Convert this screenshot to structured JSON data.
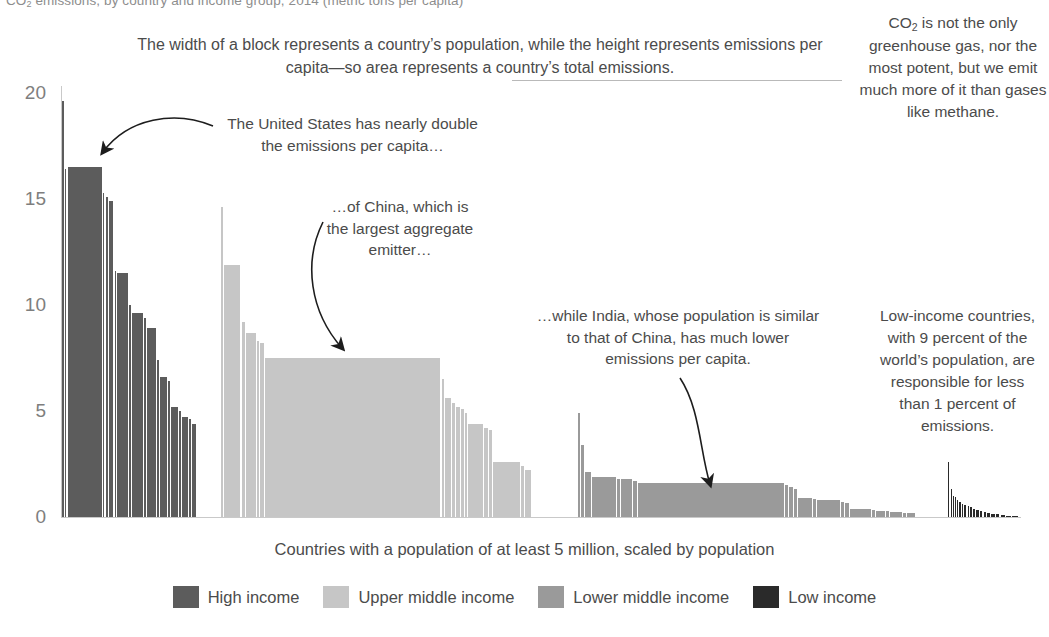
{
  "title": {
    "prefix": "CO",
    "sub": "2",
    "rest": " emissions, by country and income group, 2014 (metric tons per capita)"
  },
  "caption": "Countries with a population of at least 5 million, scaled by population",
  "annotations": {
    "top": "The width of a block represents a country’s population, while the height represents emissions per capita—so area represents a country’s total emissions.",
    "co2_pre": "CO",
    "co2_sub": "2",
    "co2_post": " is not the only greenhouse gas, nor the most potent, but we emit much more of it than gases like methane.",
    "united_states": "The United States has nearly double the emissions per capita…",
    "china": "…of China, which is the largest aggregate emitter…",
    "india": "…while India, whose population is similar to that of China, has much lower emissions per capita.",
    "low_income": "Low-income countries, with 9 percent of the world’s population, are responsible for less than 1 percent of emissions."
  },
  "legend": {
    "position": "bottom",
    "items": [
      {
        "label": "High income",
        "color": "#5c5c5c"
      },
      {
        "label": "Upper middle income",
        "color": "#c6c6c6"
      },
      {
        "label": "Lower middle income",
        "color": "#9a9a9a"
      },
      {
        "label": "Low income",
        "color": "#2a2a2a"
      }
    ]
  },
  "chart_data": {
    "type": "bar",
    "title": "CO2 emissions, by country and income group, 2014 (metric tons per capita)",
    "subtitle": "Countries with a population of at least 5 million, scaled by population",
    "xlabel": "Countries with a population of at least 5 million, scaled by population",
    "ylabel": "Metric tons per capita",
    "ylim": [
      0,
      20
    ],
    "yticks": [
      0,
      5,
      10,
      15,
      20
    ],
    "grid": false,
    "legend_position": "bottom",
    "note": "Mekko / variable-width bar chart: bar width is proportional to country population, bar height is CO2 emissions per capita, so area equals total emissions.",
    "groups": [
      {
        "name": "High income",
        "color": "#5c5c5c",
        "x_start": 62,
        "x_end": 196,
        "bars": [
          {
            "width": 2,
            "value": 19.6
          },
          {
            "width": 2,
            "value": 16.4
          },
          {
            "width": 40,
            "value": 16.5
          },
          {
            "width": 2,
            "value": 15.3
          },
          {
            "width": 3,
            "value": 15.1
          },
          {
            "width": 5,
            "value": 14.9
          },
          {
            "width": 2,
            "value": 11.6
          },
          {
            "width": 12,
            "value": 11.5
          },
          {
            "width": 3,
            "value": 10.0
          },
          {
            "width": 13,
            "value": 9.6
          },
          {
            "width": 2,
            "value": 9.4
          },
          {
            "width": 10,
            "value": 8.9
          },
          {
            "width": 2,
            "value": 7.4
          },
          {
            "width": 9,
            "value": 6.6
          },
          {
            "width": 2,
            "value": 6.4
          },
          {
            "width": 8,
            "value": 5.2
          },
          {
            "width": 2,
            "value": 5.0
          },
          {
            "width": 7,
            "value": 4.7
          },
          {
            "width": 2,
            "value": 4.6
          },
          {
            "width": 5,
            "value": 4.4
          }
        ]
      },
      {
        "name": "Upper middle income",
        "color": "#c6c6c6",
        "x_start": 221,
        "x_end": 531,
        "bars": [
          {
            "width": 2,
            "value": 14.6
          },
          {
            "width": 16,
            "value": 11.9
          },
          {
            "width": 3,
            "value": 9.2
          },
          {
            "width": 10,
            "value": 8.7
          },
          {
            "width": 2,
            "value": 8.3
          },
          {
            "width": 4,
            "value": 8.2
          },
          {
            "width": 172,
            "value": 7.5
          },
          {
            "width": 2,
            "value": 6.5
          },
          {
            "width": 6,
            "value": 5.6
          },
          {
            "width": 3,
            "value": 5.4
          },
          {
            "width": 4,
            "value": 5.2
          },
          {
            "width": 3,
            "value": 5.1
          },
          {
            "width": 2,
            "value": 4.9
          },
          {
            "width": 14,
            "value": 4.4
          },
          {
            "width": 4,
            "value": 4.2
          },
          {
            "width": 3,
            "value": 4.1
          },
          {
            "width": 26,
            "value": 2.6
          },
          {
            "width": 3,
            "value": 2.4
          },
          {
            "width": 6,
            "value": 2.2
          }
        ]
      },
      {
        "name": "Lower middle income",
        "color": "#9a9a9a",
        "x_start": 578,
        "x_end": 915,
        "bars": [
          {
            "width": 2,
            "value": 4.9
          },
          {
            "width": 3,
            "value": 3.4
          },
          {
            "width": 6,
            "value": 2.1
          },
          {
            "width": 26,
            "value": 1.9
          },
          {
            "width": 3,
            "value": 1.8
          },
          {
            "width": 12,
            "value": 1.8
          },
          {
            "width": 4,
            "value": 1.7
          },
          {
            "width": 155,
            "value": 1.6
          },
          {
            "width": 3,
            "value": 1.5
          },
          {
            "width": 4,
            "value": 1.4
          },
          {
            "width": 3,
            "value": 1.3
          },
          {
            "width": 15,
            "value": 0.9
          },
          {
            "width": 3,
            "value": 0.85
          },
          {
            "width": 25,
            "value": 0.8
          },
          {
            "width": 3,
            "value": 0.7
          },
          {
            "width": 4,
            "value": 0.65
          },
          {
            "width": 22,
            "value": 0.4
          },
          {
            "width": 3,
            "value": 0.35
          },
          {
            "width": 10,
            "value": 0.3
          },
          {
            "width": 3,
            "value": 0.28
          },
          {
            "width": 12,
            "value": 0.25
          },
          {
            "width": 4,
            "value": 0.2
          },
          {
            "width": 8,
            "value": 0.18
          }
        ]
      },
      {
        "name": "Low income",
        "color": "#2a2a2a",
        "x_start": 948,
        "x_end": 1018,
        "bars": [
          {
            "width": 2,
            "value": 2.6
          },
          {
            "width": 2,
            "value": 1.3
          },
          {
            "width": 1,
            "value": 1.0
          },
          {
            "width": 2,
            "value": 0.95
          },
          {
            "width": 1,
            "value": 0.8
          },
          {
            "width": 2,
            "value": 0.7
          },
          {
            "width": 2,
            "value": 0.62
          },
          {
            "width": 3,
            "value": 0.55
          },
          {
            "width": 2,
            "value": 0.5
          },
          {
            "width": 3,
            "value": 0.45
          },
          {
            "width": 3,
            "value": 0.4
          },
          {
            "width": 4,
            "value": 0.34
          },
          {
            "width": 3,
            "value": 0.3
          },
          {
            "width": 4,
            "value": 0.25
          },
          {
            "width": 4,
            "value": 0.2
          },
          {
            "width": 5,
            "value": 0.16
          },
          {
            "width": 5,
            "value": 0.13
          },
          {
            "width": 6,
            "value": 0.1
          },
          {
            "width": 7,
            "value": 0.07
          },
          {
            "width": 9,
            "value": 0.05
          }
        ]
      }
    ]
  }
}
